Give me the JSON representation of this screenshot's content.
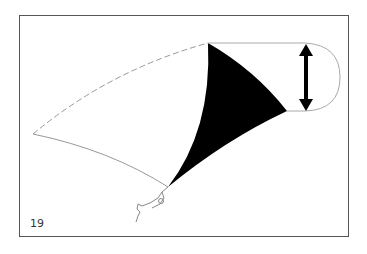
{
  "figure": {
    "number": "19",
    "colors": {
      "frame": "#555555",
      "outline": "#999999",
      "fill": "#000000",
      "background": "#ffffff"
    },
    "icons": {
      "arrow": "double-headed-vertical-arrow",
      "pilot": "pilot-figure"
    }
  }
}
